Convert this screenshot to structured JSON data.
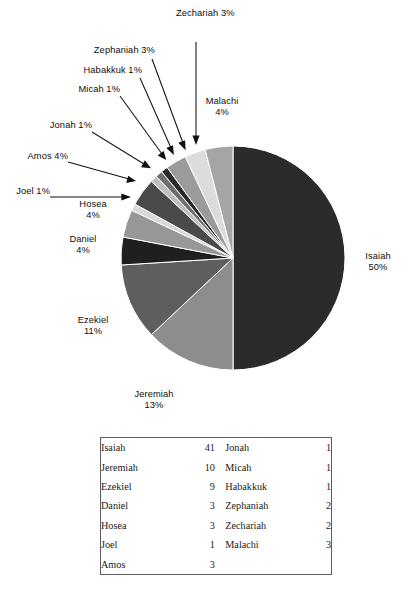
{
  "chart_data": {
    "type": "pie",
    "title": "",
    "unit": "%",
    "start_angle_deg": 0,
    "direction": "clockwise",
    "legend": "none",
    "labels_on": "callouts",
    "categories": [
      "Isaiah",
      "Jeremiah",
      "Ezekiel",
      "Daniel",
      "Hosea",
      "Joel",
      "Amos",
      "Jonah",
      "Micah",
      "Habakkuk",
      "Zephaniah",
      "Zechariah",
      "Malachi"
    ],
    "values_percent": [
      50,
      13,
      11,
      4,
      4,
      1,
      4,
      1,
      1,
      1,
      3,
      3,
      4
    ],
    "values_count": [
      41,
      10,
      9,
      3,
      3,
      1,
      3,
      1,
      1,
      1,
      2,
      2,
      3
    ],
    "colors": [
      "#2b2b2b",
      "#8d8d8d",
      "#5e5e5e",
      "#1f1f1f",
      "#979797",
      "#d8d8d8",
      "#4a4a4a",
      "#bdbdbd",
      "#6f6f6f",
      "#2a2a2a",
      "#9b9b9b",
      "#dcdcdc",
      "#a5a5a5"
    ],
    "slices": [
      {
        "name": "Isaiah",
        "percent": 50,
        "count": 41,
        "color": "#2b2b2b",
        "label": "Isaiah",
        "value_label": "50%"
      },
      {
        "name": "Jeremiah",
        "percent": 13,
        "count": 10,
        "color": "#8d8d8d",
        "label": "Jeremiah",
        "value_label": "13%"
      },
      {
        "name": "Ezekiel",
        "percent": 11,
        "count": 9,
        "color": "#5e5e5e",
        "label": "Ezekiel",
        "value_label": "11%"
      },
      {
        "name": "Daniel",
        "percent": 4,
        "count": 3,
        "color": "#1f1f1f",
        "label": "Daniel",
        "value_label": "4%"
      },
      {
        "name": "Hosea",
        "percent": 4,
        "count": 3,
        "color": "#979797",
        "label": "Hosea",
        "value_label": "4%"
      },
      {
        "name": "Joel",
        "percent": 1,
        "count": 1,
        "color": "#d8d8d8",
        "label": "Joel",
        "value_label": "1%"
      },
      {
        "name": "Amos",
        "percent": 4,
        "count": 3,
        "color": "#4a4a4a",
        "label": "Amos",
        "value_label": "4%"
      },
      {
        "name": "Jonah",
        "percent": 1,
        "count": 1,
        "color": "#bdbdbd",
        "label": "Jonah",
        "value_label": "1%"
      },
      {
        "name": "Micah",
        "percent": 1,
        "count": 1,
        "color": "#6f6f6f",
        "label": "Micah",
        "value_label": "1%"
      },
      {
        "name": "Habakkuk",
        "percent": 1,
        "count": 1,
        "color": "#2a2a2a",
        "label": "Habakkuk",
        "value_label": "1%"
      },
      {
        "name": "Zephaniah",
        "percent": 3,
        "count": 2,
        "color": "#9b9b9b",
        "label": "Zephaniah",
        "value_label": "3%"
      },
      {
        "name": "Zechariah",
        "percent": 3,
        "count": 2,
        "color": "#dcdcdc",
        "label": "Zechariah",
        "value_label": "3%"
      },
      {
        "name": "Malachi",
        "percent": 4,
        "count": 3,
        "color": "#a5a5a5",
        "label": "Malachi",
        "value_label": "4%"
      }
    ]
  },
  "callouts": {
    "zechariah": "Zechariah 3%",
    "zephaniah": "Zephaniah 3%",
    "habakkuk": "Habakkuk 1%",
    "micah": "Micah 1%",
    "jonah": "Jonah 1%",
    "amos": "Amos 4%",
    "joel": "Joel 1%",
    "malachi_name": "Malachi",
    "malachi_pct": "4%",
    "hosea_name": "Hosea",
    "hosea_pct": "4%",
    "daniel_name": "Daniel",
    "daniel_pct": "4%",
    "ezekiel_name": "Ezekiel",
    "ezekiel_pct": "11%",
    "jeremiah_name": "Jeremiah",
    "jeremiah_pct": "13%",
    "isaiah_name": "Isaiah",
    "isaiah_pct": "50%"
  },
  "table": {
    "left_rows": [
      {
        "name": "Isaiah",
        "count": "41"
      },
      {
        "name": "Jeremiah",
        "count": "10"
      },
      {
        "name": "Ezekiel",
        "count": "9"
      },
      {
        "name": "Daniel",
        "count": "3"
      },
      {
        "name": "Hosea",
        "count": "3"
      },
      {
        "name": "Joel",
        "count": "1"
      },
      {
        "name": "Amos",
        "count": "3"
      }
    ],
    "right_rows": [
      {
        "name": "Jonah",
        "count": "1"
      },
      {
        "name": "Micah",
        "count": "1"
      },
      {
        "name": "Habakkuk",
        "count": "1"
      },
      {
        "name": "Zephaniah",
        "count": "2"
      },
      {
        "name": "Zechariah",
        "count": "2"
      },
      {
        "name": "Malachi",
        "count": "3"
      },
      {
        "name": "",
        "count": ""
      }
    ]
  },
  "style": {
    "border_color": "#5d5d5d",
    "text_color": "#111111",
    "background": "#ffffff"
  }
}
